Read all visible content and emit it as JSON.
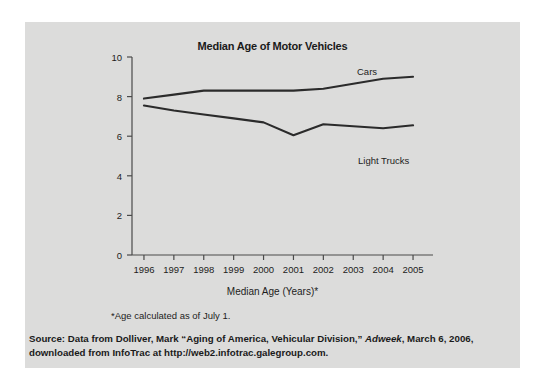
{
  "chart_data": {
    "type": "line",
    "title": "Median Age of Motor Vehicles",
    "xlabel": "Median Age (Years)*",
    "ylabel": "",
    "x": [
      1996,
      1997,
      1998,
      1999,
      2000,
      2001,
      2002,
      2003,
      2004,
      2005
    ],
    "categories": [
      "1996",
      "1997",
      "1998",
      "1999",
      "2000",
      "2001",
      "2002",
      "2003",
      "2004",
      "2005"
    ],
    "series": [
      {
        "name": "Cars",
        "values": [
          7.9,
          8.1,
          8.3,
          8.3,
          8.3,
          8.3,
          8.4,
          8.65,
          8.9,
          9.0
        ]
      },
      {
        "name": "Light Trucks",
        "values": [
          7.55,
          7.3,
          7.1,
          6.9,
          6.7,
          6.05,
          6.6,
          6.5,
          6.4,
          6.55
        ]
      }
    ],
    "xlim": [
      1995.6,
      2005.4
    ],
    "ylim": [
      0,
      10
    ],
    "yticks": [
      "0",
      "2",
      "4",
      "6",
      "8",
      "10"
    ],
    "ytick_values": [
      0,
      2,
      4,
      6,
      8,
      10
    ],
    "xticks": [
      "1996",
      "1997",
      "1998",
      "1999",
      "2000",
      "2001",
      "2002",
      "2003",
      "2004",
      "2005"
    ],
    "grid": false,
    "legend_position": "inline-right",
    "line_color": "#2b2b2b",
    "background_color": "#dcdcdb",
    "axis_color": "#4a4a4a"
  },
  "annotations": {
    "footnote": "*Age calculated as of July 1."
  },
  "source": {
    "prefix": "Source: Data from Dolliver, Mark “Aging of America, Vehicular Division,” ",
    "publication": "Adweek",
    "suffix": ", March 6, 2006, downloaded from InfoTrac at http://web2.infotrac.galegroup.com."
  }
}
